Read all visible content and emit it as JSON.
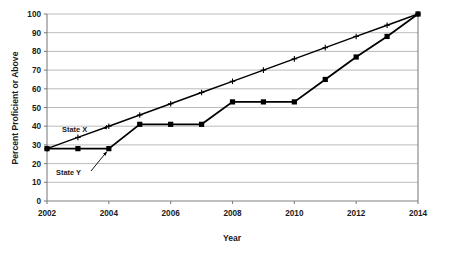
{
  "chart_data": {
    "type": "line",
    "title": "",
    "xlabel": "Year",
    "ylabel": "Percent Proficient or Above",
    "x": [
      2002,
      2003,
      2004,
      2005,
      2006,
      2007,
      2008,
      2009,
      2010,
      2011,
      2012,
      2013,
      2014
    ],
    "xlim": [
      2002,
      2014
    ],
    "ylim": [
      0,
      100
    ],
    "xticks": [
      2002,
      2004,
      2006,
      2008,
      2010,
      2012,
      2014
    ],
    "yticks": [
      0,
      10,
      20,
      30,
      40,
      50,
      60,
      70,
      80,
      90,
      100
    ],
    "grid": "horizontal",
    "legend": "inline-annotations",
    "series": [
      {
        "name": "State X",
        "marker": "plus",
        "values": [
          28,
          34,
          40,
          46,
          52,
          58,
          64,
          70,
          76,
          82,
          88,
          94,
          100
        ]
      },
      {
        "name": "State Y",
        "marker": "square",
        "values": [
          28,
          28,
          28,
          41,
          41,
          41,
          53,
          53,
          53,
          65,
          77,
          88,
          100
        ]
      }
    ],
    "annotations": [
      {
        "text": "State X",
        "points_to_x": 2004,
        "points_to_y": 40
      },
      {
        "text": "State Y",
        "points_to_x": 2004,
        "points_to_y": 28
      }
    ]
  },
  "axis": {
    "y_tick_labels": [
      "100",
      "90",
      "80",
      "70",
      "60",
      "50",
      "40",
      "30",
      "20",
      "10",
      "0"
    ],
    "x_tick_labels": [
      "2002",
      "2004",
      "2006",
      "2008",
      "2010",
      "2012",
      "2014"
    ],
    "y_title": "Percent Proficient or Above",
    "x_title": "Year"
  },
  "labels": {
    "state_x": "State X",
    "state_y": "State Y"
  },
  "colors": {
    "line": "#000000",
    "grid": "#a9a9a9",
    "axis": "#808080",
    "background": "#ffffff",
    "text": "#1a1a1a"
  }
}
